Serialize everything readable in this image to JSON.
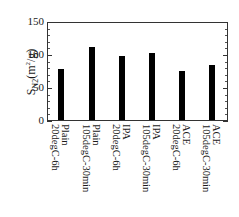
{
  "chart_data": {
    "type": "bar",
    "title": "",
    "xlabel": "",
    "ylabel": "S_N2(m^2/g)",
    "ylabel_parts": {
      "main": "S",
      "sub": "N2",
      "unit_pre": "(m",
      "sup": "2",
      "unit_post": "/g)"
    },
    "ylim": [
      0,
      150
    ],
    "yticks": [
      0,
      50,
      100,
      150
    ],
    "grid": false,
    "legend": null,
    "categories": [
      "Plain 20degC-6h",
      "Plain 105degC-30min",
      "IPA 20degC-6h",
      "IPA 105degC-30min",
      "ACE 20degC-6h",
      "ACE 105degC-30min"
    ],
    "category_lines": [
      [
        "Plain",
        "20degC-6h"
      ],
      [
        "Plain",
        "105degC-30min"
      ],
      [
        "IPA",
        "20degC-6h"
      ],
      [
        "IPA",
        "105degC-30min"
      ],
      [
        "ACE",
        "20degC-6h"
      ],
      [
        "ACE",
        "105degC-30min"
      ]
    ],
    "values": [
      78,
      110,
      97,
      102,
      74,
      84
    ],
    "bar_color": "#000000"
  }
}
